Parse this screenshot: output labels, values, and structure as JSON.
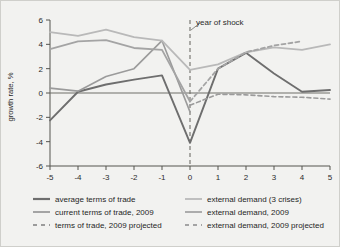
{
  "chart_data": {
    "type": "line",
    "title": "",
    "xlabel": "",
    "ylabel": "growth rate, %",
    "xlim": [
      -5,
      5
    ],
    "ylim": [
      -6,
      6
    ],
    "yticks": [
      6,
      4,
      2,
      0,
      -2,
      -4,
      -6
    ],
    "xticks": [
      -5,
      -4,
      -3,
      -2,
      -1,
      0,
      1,
      2,
      3,
      4,
      5
    ],
    "ytick_labels": [
      "6",
      "4",
      "2",
      "0",
      "-2",
      "-4",
      "-6"
    ],
    "xtick_labels": [
      "-5",
      "-4",
      "-3",
      "-2",
      "-1",
      "0",
      "1",
      "2",
      "3",
      "4",
      "5"
    ],
    "grid": false,
    "legend_position": "below",
    "x": [
      -5,
      -4,
      -3,
      -2,
      -1,
      0,
      1,
      2,
      3,
      4,
      5
    ],
    "series": [
      {
        "name": "average terms of trade",
        "color": "#6e6e6e",
        "style": "solid",
        "width": 1.9,
        "values": [
          -2.25,
          0.1,
          0.7,
          1.1,
          1.45,
          -4.1,
          2.0,
          3.3,
          1.6,
          0.1,
          0.25
        ]
      },
      {
        "name": "current terms of trade, 2009",
        "color": "#9b9b9b",
        "style": "solid",
        "width": 1.6,
        "values": [
          0.4,
          0.15,
          1.35,
          2.0,
          4.3,
          -1.55,
          null,
          null,
          null,
          null,
          null
        ]
      },
      {
        "name": "terms of trade, 2009 projected",
        "color": "#9b9b9b",
        "style": "dashed",
        "width": 1.6,
        "values": [
          null,
          null,
          null,
          null,
          null,
          -1.0,
          -0.1,
          -0.15,
          -0.3,
          -0.35,
          -0.5
        ]
      },
      {
        "name": "external demand (3 crises)",
        "color": "#b9b9b9",
        "style": "solid",
        "width": 1.8,
        "values": [
          5.0,
          4.7,
          5.2,
          4.6,
          4.3,
          1.9,
          2.35,
          3.35,
          3.75,
          3.55,
          4.0
        ]
      },
      {
        "name": "external demand, 2009",
        "color": "#a4a4a4",
        "style": "solid",
        "width": 1.8,
        "values": [
          3.6,
          4.25,
          4.35,
          3.7,
          3.55,
          -0.7,
          null,
          null,
          null,
          null,
          null
        ]
      },
      {
        "name": "external demand, 2009 projected",
        "color": "#a4a4a4",
        "style": "dashed",
        "width": 1.8,
        "values": [
          null,
          null,
          null,
          null,
          null,
          -0.7,
          2.0,
          3.35,
          3.9,
          4.25,
          null
        ]
      }
    ],
    "annotations": [
      {
        "text": "year of shock",
        "x": 0,
        "note": "dashed vertical reference line at x = 0 with leader to label"
      }
    ]
  },
  "legend": {
    "items": [
      {
        "label": "average terms of trade",
        "color": "#6e6e6e",
        "style": "solid",
        "width": 2.2
      },
      {
        "label": "external demand (3 crises)",
        "color": "#b9b9b9",
        "style": "solid",
        "width": 1.8
      },
      {
        "label": "current terms of trade, 2009",
        "color": "#9b9b9b",
        "style": "solid",
        "width": 1.8
      },
      {
        "label": "external demand, 2009",
        "color": "#a4a4a4",
        "style": "solid",
        "width": 1.8
      },
      {
        "label": "terms of trade, 2009 projected",
        "color": "#9b9b9b",
        "style": "dashed",
        "width": 1.8
      },
      {
        "label": "external demand, 2009 projected",
        "color": "#a4a4a4",
        "style": "dashed",
        "width": 1.8
      }
    ]
  }
}
